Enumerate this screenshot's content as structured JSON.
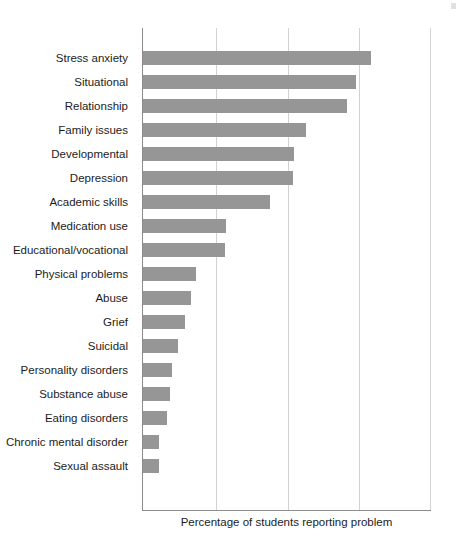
{
  "chart_data": {
    "type": "bar",
    "orientation": "horizontal",
    "title": "",
    "xlabel": "Percentage of students reporting problem",
    "ylabel": "",
    "xlim": [
      0,
      40
    ],
    "grid": true,
    "gridline_values": [
      0,
      10,
      20,
      30,
      40
    ],
    "legend": "none",
    "tick_labels_shown": false,
    "bar_color": "#969696",
    "axis_color": "#8c8c8c",
    "grid_color": "#d2d2d2",
    "categories": [
      "Stress anxiety",
      "Situational",
      "Relationship",
      "Family issues",
      "Developmental",
      "Depression",
      "Academic skills",
      "Medication use",
      "Educational/vocational",
      "Physical problems",
      "Abuse",
      "Grief",
      "Suicidal",
      "Personality disorders",
      "Substance abuse",
      "Eating disorders",
      "Chronic mental disorder",
      "Sexual assault"
    ],
    "values": [
      31.7,
      29.6,
      28.3,
      22.6,
      21.0,
      20.8,
      17.6,
      11.5,
      11.4,
      7.4,
      6.6,
      5.8,
      4.9,
      4.0,
      3.7,
      3.3,
      2.2,
      2.2
    ],
    "bar_pixel_widths": [
      228,
      213,
      204,
      163,
      151,
      150,
      127,
      83,
      82,
      53,
      48,
      42,
      35,
      29,
      27,
      24,
      16,
      16
    ]
  },
  "axis": {
    "x_title": "Percentage of students reporting problem"
  }
}
